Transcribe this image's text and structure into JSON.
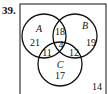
{
  "problem_number": "39.",
  "venn": {
    "sets": [
      "A",
      "B",
      "C"
    ],
    "regions": {
      "A_only": "21",
      "B_only": "19",
      "C_only": "17",
      "A_and_B_only": "18",
      "A_and_C_only": "11",
      "B_and_C_only": "12",
      "A_B_C": "4",
      "outside": "14"
    }
  }
}
